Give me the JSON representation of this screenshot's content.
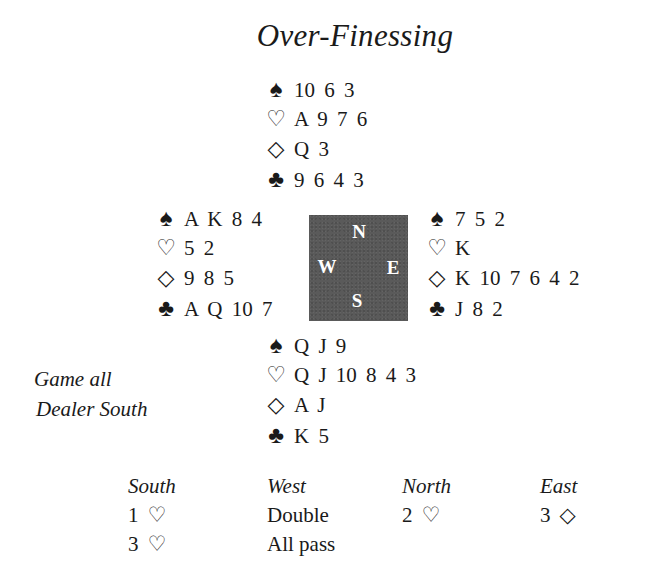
{
  "title": "Over-Finessing",
  "suit_icons": {
    "spades": "♠",
    "hearts": "♡",
    "diamonds": "◇",
    "clubs": "♣"
  },
  "hands": {
    "north": {
      "spades": "10 6 3",
      "hearts": "A 9 7 6",
      "diamonds": "Q 3",
      "clubs": "9 6 4 3"
    },
    "west": {
      "spades": "A K 8 4",
      "hearts": "5 2",
      "diamonds": "9 8 5",
      "clubs": "A Q 10 7"
    },
    "east": {
      "spades": "7 5 2",
      "hearts": "K",
      "diamonds": "K 10 7 6 4 2",
      "clubs": "J 8 2"
    },
    "south": {
      "spades": "Q J 9",
      "hearts": "Q J 10 8 4 3",
      "diamonds": "A J",
      "clubs": "K 5"
    }
  },
  "compass": {
    "north": "N",
    "west": "W",
    "east": "E",
    "south": "S",
    "background_color": "#5a5a5a"
  },
  "conditions": {
    "vulnerability": "Game all",
    "dealer": "Dealer South"
  },
  "auction": {
    "headers": [
      "South",
      "West",
      "North",
      "East"
    ],
    "rounds": [
      [
        {
          "level": "1",
          "suit": "♡"
        },
        {
          "text": "Double"
        },
        {
          "level": "2",
          "suit": "♡"
        },
        {
          "level": "3",
          "suit": "◇"
        }
      ],
      [
        {
          "level": "3",
          "suit": "♡"
        },
        {
          "text": "All pass"
        },
        {
          "text": ""
        },
        {
          "text": ""
        }
      ]
    ]
  }
}
